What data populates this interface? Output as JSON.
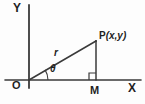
{
  "figure": {
    "kind": "right-triangle-polar-coordinates-diagram",
    "background_color": "#fdfdfd",
    "stroke_color": "#3a3a3a",
    "labels": {
      "axis_y": "Y",
      "axis_x": "X",
      "origin": "O",
      "foot_of_perpendicular": "M",
      "point_name": "P",
      "point_coordinates": "(x,y)",
      "radius": "r",
      "angle": "θ"
    },
    "geometry": {
      "origin": {
        "x": 29,
        "y": 80
      },
      "point_p": {
        "x": 96,
        "y": 41
      },
      "point_m": {
        "x": 96,
        "y": 80
      },
      "y_axis": {
        "x": 29,
        "y_top": 5,
        "y_bottom": 88
      },
      "x_axis": {
        "y": 80,
        "x_left": 5,
        "x_right": 141
      },
      "right_angle_marker": {
        "x": 89,
        "y": 73,
        "size": 7
      },
      "angle_arc_radius": 19
    }
  }
}
